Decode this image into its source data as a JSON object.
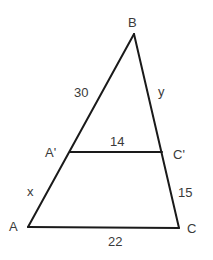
{
  "diagram": {
    "type": "similar-triangles",
    "vertices": {
      "B": {
        "label": "B",
        "x": 134,
        "y": 34
      },
      "A": {
        "label": "A",
        "x": 28,
        "y": 227
      },
      "C": {
        "label": "C",
        "x": 179,
        "y": 228
      },
      "A_prime": {
        "label": "A'",
        "x": 70,
        "y": 152
      },
      "C_prime": {
        "label": "C'",
        "x": 162,
        "y": 152
      }
    },
    "segments": {
      "BA_prime": {
        "label": "30"
      },
      "BC_prime": {
        "label": "y"
      },
      "A_primeC_prime": {
        "label": "14"
      },
      "A_primeA": {
        "label": "x"
      },
      "C_primeC": {
        "label": "15"
      },
      "AC": {
        "label": "22"
      }
    },
    "stroke_color": "#1a1a1a",
    "label_color": "#3a3a3a"
  }
}
